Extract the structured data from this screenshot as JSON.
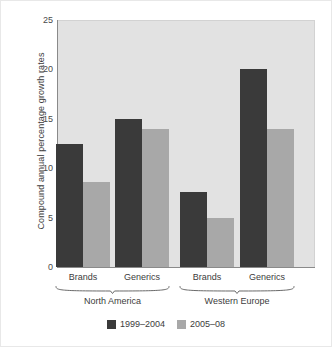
{
  "colors": {
    "series_1999_2004": "#3a3a3a",
    "series_2005_08": "#a8a8a8",
    "plot_background": "#e2e2e2",
    "axis": "#8a8a8a",
    "page_background": "#ffffff",
    "text": "#3c3c3c"
  },
  "chart_data": {
    "type": "bar",
    "title": "",
    "xlabel": "",
    "ylabel": "Compound annual percentage growth rates",
    "ylim": [
      0,
      25
    ],
    "yticks": [
      0,
      5,
      10,
      15,
      20,
      25
    ],
    "ytick_labels": [
      "0",
      "5",
      "10",
      "15",
      "20",
      "25"
    ],
    "grid": false,
    "legend_position": "bottom",
    "categories": [
      "Brands",
      "Generics",
      "Brands",
      "Generics"
    ],
    "groups": [
      {
        "label": "North America",
        "categories": [
          "Brands",
          "Generics"
        ]
      },
      {
        "label": "Western Europe",
        "categories": [
          "Brands",
          "Generics"
        ]
      }
    ],
    "series": [
      {
        "name": "1999–2004",
        "color": "#3a3a3a",
        "values": [
          12.5,
          15.0,
          7.6,
          20.0
        ]
      },
      {
        "name": "2005–08",
        "color": "#a8a8a8",
        "values": [
          8.6,
          14.0,
          5.0,
          14.0
        ]
      }
    ]
  },
  "legend": {
    "items": [
      {
        "label": "1999–2004",
        "color": "#3a3a3a"
      },
      {
        "label": "2005–08",
        "color": "#a8a8a8"
      }
    ]
  }
}
